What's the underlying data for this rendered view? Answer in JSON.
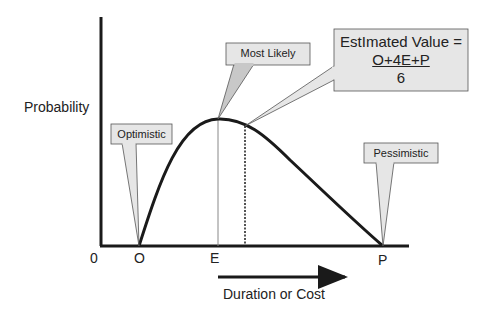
{
  "diagram": {
    "y_axis_label": "Probability",
    "x_axis_label": "Duration or Cost",
    "origin_label": "0",
    "tick_labels": {
      "optimistic": "O",
      "most_likely": "E",
      "pessimistic": "P"
    },
    "callouts": {
      "optimistic": "Optimistic",
      "most_likely": "Most Likely",
      "pessimistic": "Pessimistic",
      "estimated_value": {
        "line1": "EstImated Value =",
        "numerator": "O+4E+P",
        "denominator": "6"
      }
    },
    "colors": {
      "line": "#1a1a1a",
      "callout_fill": "#e6e6e6",
      "callout_stroke": "#555555",
      "guide_line": "#888888"
    }
  }
}
